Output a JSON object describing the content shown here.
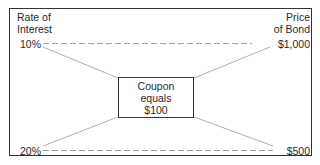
{
  "diagram": {
    "left_axis_title": [
      "Rate of",
      "Interest"
    ],
    "right_axis_title": [
      "Price",
      "of Bond"
    ],
    "left_values": {
      "top": "10%",
      "bottom": "20%"
    },
    "right_values": {
      "top": "$1,000",
      "bottom": "$500"
    },
    "center_box": [
      "Coupon",
      "equals",
      "$100"
    ],
    "colors": {
      "border": "#333333",
      "line": "#9a9a9a",
      "text": "#2a2a2a"
    }
  }
}
